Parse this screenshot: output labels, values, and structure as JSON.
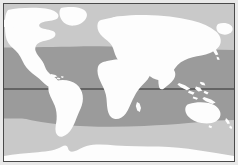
{
  "figure": {
    "width": 238,
    "height": 165,
    "background_color": "#e9e9e9",
    "border_color": "#4a4a4a",
    "title": "",
    "caption": ""
  },
  "map": {
    "projection": "equirectangular",
    "frame": {
      "x": 3,
      "y": 3,
      "width": 232,
      "height": 159
    },
    "colors": {
      "ocean_light": "#c9c9c9",
      "ocean_band_dark": "#9b9b9b",
      "land": "#fdfdfd",
      "equator_line": "#2f2f2f",
      "border": "#4a4a4a"
    },
    "highlight_band": {
      "label": "tropical-zone-band",
      "fill": "#9b9b9b",
      "top_y_left": 46,
      "top_y_right": 49,
      "bottom_y_left": 117,
      "bottom_y_right": 119
    },
    "equator": {
      "label": "equator-line",
      "y": 88,
      "stroke": "#2f2f2f",
      "stroke_width": 1
    },
    "landmasses": [
      {
        "name": "north-america"
      },
      {
        "name": "greenland"
      },
      {
        "name": "south-america"
      },
      {
        "name": "europe"
      },
      {
        "name": "africa"
      },
      {
        "name": "asia"
      },
      {
        "name": "japan"
      },
      {
        "name": "southeast-asia-islands"
      },
      {
        "name": "australia"
      },
      {
        "name": "new-zealand"
      },
      {
        "name": "antarctica"
      },
      {
        "name": "madagascar"
      },
      {
        "name": "british-isles"
      },
      {
        "name": "caribbean"
      }
    ]
  },
  "chart_data": {
    "type": "map",
    "title": "",
    "xlabel": "",
    "ylabel": "",
    "projection": "equirectangular",
    "shaded_bands": [
      {
        "name": "tropical-zone-band",
        "color": "#9b9b9b",
        "top_edge_px": 46,
        "bottom_edge_px": 118,
        "description": "horizontal shaded latitude band spanning full map width"
      }
    ],
    "reference_lines": [
      {
        "name": "equator",
        "orientation": "horizontal",
        "y_px": 88,
        "color": "#2f2f2f"
      }
    ],
    "legend": [],
    "annotations": []
  }
}
